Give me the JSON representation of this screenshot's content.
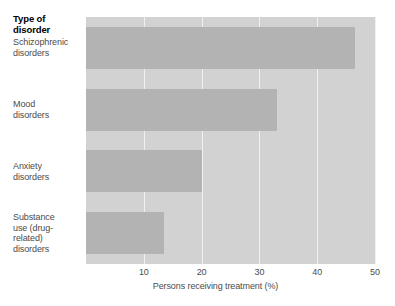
{
  "chart_data": {
    "type": "bar",
    "orientation": "horizontal",
    "title": "",
    "ylabel": "Type of disorder",
    "xlabel": "Persons receiving treatment (%)",
    "xlim": [
      0,
      50
    ],
    "xticks": [
      10,
      20,
      30,
      40,
      50
    ],
    "xticklabels": [
      "10",
      "20",
      "30",
      "40",
      "50"
    ],
    "grid": "vertical",
    "legend": "none",
    "categories": [
      "Schizophrenic disorders",
      "Mood disorders",
      "Anxiety disorders",
      "Substance use (drug-related) disorders"
    ],
    "category_lines": [
      [
        "Schizophrenic",
        "disorders"
      ],
      [
        "Mood",
        "disorders"
      ],
      [
        "Anxiety",
        "disorders"
      ],
      [
        "Substance",
        "use (drug-",
        "related)",
        "disorders"
      ]
    ],
    "values": [
      46.5,
      33,
      20,
      13.5
    ],
    "colors": {
      "bar": "#b3b3b3",
      "plot_background": "#d2d2d2",
      "gridline": "#f0f0f0",
      "text": "#4c4c4c",
      "title_text": "#000000",
      "figure_background": "#ffffff"
    }
  }
}
